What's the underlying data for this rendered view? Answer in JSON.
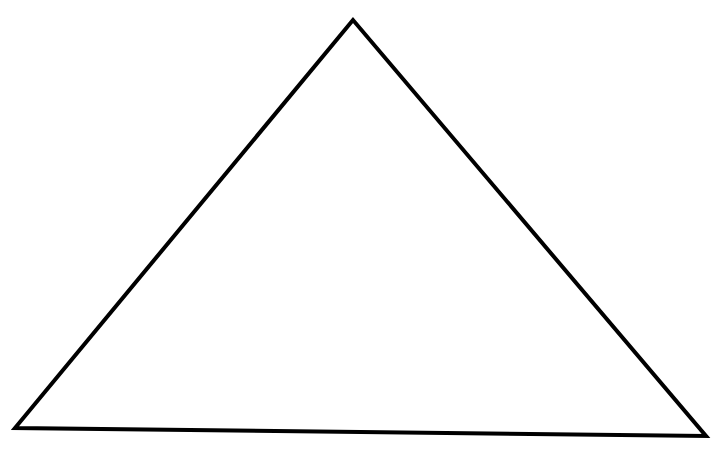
{
  "diagram": {
    "shape": "triangle",
    "fill": "none",
    "stroke_color": "#000000",
    "stroke_width": 4,
    "vertices": {
      "apex": [
        353,
        20
      ],
      "bottom_left": [
        15,
        428
      ],
      "bottom_right": [
        706,
        436
      ]
    }
  }
}
